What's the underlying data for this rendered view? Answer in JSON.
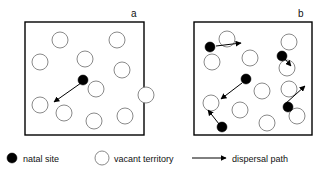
{
  "figure": {
    "type": "scientific-diagram",
    "background": "#ffffff",
    "width": 324,
    "height": 172,
    "colors": {
      "natal_fill": "#000000",
      "vacant_fill": "#ffffff",
      "vacant_stroke": "#8a8a8a",
      "box_stroke": "#000000",
      "arrow": "#000000",
      "text": "#111111"
    }
  },
  "panels": [
    {
      "id": "panel-a",
      "label": "a",
      "label_pos": {
        "x": 131,
        "y": 17
      },
      "box": {
        "x": 25,
        "y": 22,
        "w": 119,
        "h": 113
      },
      "vacant_territories": [
        {
          "cx": 60,
          "cy": 40,
          "r": 8
        },
        {
          "cx": 117,
          "cy": 40,
          "r": 8
        },
        {
          "cx": 40,
          "cy": 62,
          "r": 8
        },
        {
          "cx": 85,
          "cy": 59,
          "r": 8
        },
        {
          "cx": 122,
          "cy": 70,
          "r": 8
        },
        {
          "cx": 96,
          "cy": 89,
          "r": 8
        },
        {
          "cx": 40,
          "cy": 105,
          "r": 8
        },
        {
          "cx": 64,
          "cy": 113,
          "r": 8
        },
        {
          "cx": 94,
          "cy": 121,
          "r": 8
        },
        {
          "cx": 125,
          "cy": 116,
          "r": 8
        },
        {
          "cx": 146,
          "cy": 95,
          "r": 8
        }
      ],
      "natal_sites": [
        {
          "cx": 83,
          "cy": 80,
          "r": 5
        }
      ],
      "dispersal_paths": [
        {
          "x1": 81,
          "y1": 83,
          "x2": 54,
          "y2": 102
        }
      ]
    },
    {
      "id": "panel-b",
      "label": "b",
      "label_pos": {
        "x": 298,
        "y": 17
      },
      "box": {
        "x": 194,
        "y": 22,
        "w": 118,
        "h": 113
      },
      "vacant_territories": [
        {
          "cx": 227,
          "cy": 39,
          "r": 8
        },
        {
          "cx": 289,
          "cy": 42,
          "r": 8
        },
        {
          "cx": 212,
          "cy": 62,
          "r": 8
        },
        {
          "cx": 250,
          "cy": 58,
          "r": 8
        },
        {
          "cx": 287,
          "cy": 68,
          "r": 8
        },
        {
          "cx": 289,
          "cy": 89,
          "r": 8
        },
        {
          "cx": 262,
          "cy": 91,
          "r": 8
        },
        {
          "cx": 211,
          "cy": 103,
          "r": 8
        },
        {
          "cx": 240,
          "cy": 110,
          "r": 8
        },
        {
          "cx": 267,
          "cy": 123,
          "r": 8
        },
        {
          "cx": 297,
          "cy": 116,
          "r": 8
        }
      ],
      "natal_sites": [
        {
          "cx": 210,
          "cy": 47,
          "r": 5
        },
        {
          "cx": 282,
          "cy": 56,
          "r": 5
        },
        {
          "cx": 246,
          "cy": 79,
          "r": 5
        },
        {
          "cx": 288,
          "cy": 107,
          "r": 5
        },
        {
          "cx": 222,
          "cy": 127,
          "r": 5
        }
      ],
      "dispersal_paths": [
        {
          "x1": 216,
          "y1": 46,
          "x2": 241,
          "y2": 43
        },
        {
          "x1": 285,
          "y1": 59,
          "x2": 291,
          "y2": 66
        },
        {
          "x1": 242,
          "y1": 83,
          "x2": 221,
          "y2": 99
        },
        {
          "x1": 285,
          "y1": 104,
          "x2": 305,
          "y2": 86
        },
        {
          "x1": 219,
          "y1": 124,
          "x2": 208,
          "y2": 110
        }
      ]
    }
  ],
  "legend": {
    "items": [
      {
        "key": "natal-site",
        "symbol": "filled-circle",
        "label": "natal site",
        "marker": {
          "cx": 12,
          "cy": 158,
          "r": 5
        },
        "text_pos": {
          "x": 23,
          "y": 162
        }
      },
      {
        "key": "vacant-territory",
        "symbol": "open-circle",
        "label": "vacant territory",
        "marker": {
          "cx": 102,
          "cy": 158,
          "r": 7
        },
        "text_pos": {
          "x": 114,
          "y": 162
        }
      },
      {
        "key": "dispersal-path",
        "symbol": "arrow",
        "label": "dispersal path",
        "marker": {
          "x1": 192,
          "y1": 158,
          "x2": 226,
          "y2": 158
        },
        "text_pos": {
          "x": 232,
          "y": 162
        }
      }
    ]
  }
}
